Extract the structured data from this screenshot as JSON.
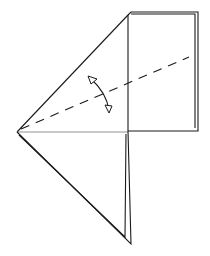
{
  "diagram": {
    "type": "origami-fold-step",
    "colors": {
      "line": "#1a1a1a",
      "light_line": "#777777",
      "paper": "#ffffff"
    },
    "elements": {
      "left_point": [
        17,
        132
      ],
      "top_corner": [
        128,
        15
      ],
      "rectangle": {
        "x": 128,
        "y": 13,
        "w": 69,
        "h": 118
      },
      "bottom_point_outer": [
        131,
        244
      ],
      "bottom_point_inner": [
        125,
        237
      ],
      "valley_fold_line": {
        "from": [
          20,
          130
        ],
        "to": [
          189,
          57
        ]
      },
      "fold_arrow": "curved-double-arrow"
    }
  }
}
